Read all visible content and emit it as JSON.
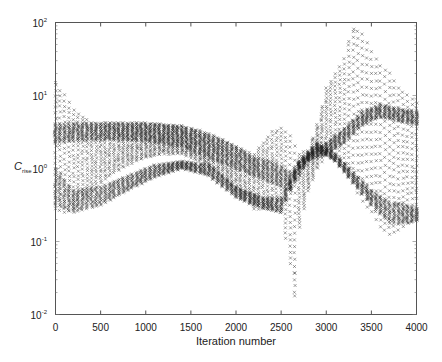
{
  "chart_data": {
    "type": "scatter",
    "title": "",
    "xlabel": "Iteration number",
    "ylabel": "C",
    "ylabel_subscript": "rise",
    "yscale": "log",
    "xlim": [
      0,
      4000
    ],
    "ylim": [
      0.01,
      100
    ],
    "xticks": [
      0,
      500,
      1000,
      1500,
      2000,
      2500,
      3000,
      3500,
      4000
    ],
    "yticks": [
      {
        "value": 100,
        "label_base": "10",
        "label_exp": "2"
      },
      {
        "value": 10,
        "label_base": "10",
        "label_exp": "1"
      },
      {
        "value": 1,
        "label_base": "10",
        "label_exp": "0"
      },
      {
        "value": 0.1,
        "label_base": "10",
        "label_exp": "-1"
      },
      {
        "value": 0.01,
        "label_base": "10",
        "label_exp": "-2"
      }
    ],
    "grid": false,
    "legend": null,
    "marker": "x",
    "column_step": 50,
    "envelope_x": [
      0,
      100,
      200,
      400,
      600,
      800,
      1000,
      1200,
      1400,
      1600,
      1800,
      2000,
      2200,
      2400,
      2500,
      2600,
      2650,
      2700,
      2800,
      2900,
      3000,
      3200,
      3300,
      3400,
      3500,
      3600,
      3700,
      3800,
      3900,
      4000
    ],
    "upper_log10": [
      1.15,
      1.0,
      0.8,
      0.62,
      0.62,
      0.62,
      0.62,
      0.6,
      0.58,
      0.52,
      0.42,
      0.3,
      0.2,
      0.5,
      0.55,
      0.45,
      0.3,
      0.2,
      0.25,
      0.6,
      1.1,
      1.5,
      1.9,
      1.85,
      1.6,
      1.4,
      1.3,
      1.1,
      1.0,
      0.9
    ],
    "lower_log10": [
      -0.55,
      -0.6,
      -0.55,
      -0.3,
      -0.1,
      0.05,
      0.15,
      0.2,
      0.2,
      0.1,
      -0.05,
      -0.3,
      -0.55,
      -0.55,
      -0.6,
      -1.3,
      -1.7,
      -0.8,
      -0.3,
      0.0,
      0.2,
      0.0,
      -0.2,
      -0.45,
      -0.6,
      -0.8,
      -0.9,
      -0.85,
      -0.75,
      -0.7
    ],
    "dense_band_log10": [
      {
        "name": "upper band",
        "x": [
          0,
          200,
          600,
          1000,
          1400,
          1800,
          2000,
          2200,
          2400,
          2600,
          2800,
          3000,
          3200,
          3400,
          3600,
          3800,
          4000
        ],
        "hi": [
          0.6,
          0.62,
          0.62,
          0.62,
          0.58,
          0.42,
          0.3,
          0.15,
          0.1,
          -0.05,
          0.2,
          0.35,
          0.55,
          0.78,
          0.88,
          0.82,
          0.78
        ],
        "lo": [
          0.35,
          0.38,
          0.4,
          0.38,
          0.3,
          0.1,
          0.0,
          -0.1,
          -0.2,
          -0.3,
          0.1,
          0.2,
          0.35,
          0.6,
          0.7,
          0.65,
          0.6
        ]
      },
      {
        "name": "lower band",
        "x": [
          0,
          200,
          500,
          800,
          1100,
          1400,
          1700,
          2000,
          2300,
          2500,
          2700,
          2900,
          3100,
          3300,
          3500,
          3700,
          3900,
          4000
        ],
        "hi": [
          0.0,
          -0.3,
          -0.25,
          -0.1,
          0.05,
          0.1,
          0.05,
          -0.25,
          -0.4,
          -0.4,
          0.1,
          0.35,
          0.2,
          -0.05,
          -0.3,
          -0.45,
          -0.5,
          -0.55
        ],
        "lo": [
          -0.5,
          -0.6,
          -0.5,
          -0.3,
          -0.12,
          0.0,
          -0.1,
          -0.4,
          -0.55,
          -0.6,
          0.0,
          0.25,
          0.1,
          -0.2,
          -0.5,
          -0.75,
          -0.75,
          -0.72
        ]
      }
    ],
    "notable_points": [
      {
        "x": 0,
        "y": 15
      },
      {
        "x": 2650,
        "y": 0.037
      },
      {
        "x": 2650,
        "y": 0.018
      },
      {
        "x": 3250,
        "y": 55
      },
      {
        "x": 3300,
        "y": 75
      }
    ]
  }
}
